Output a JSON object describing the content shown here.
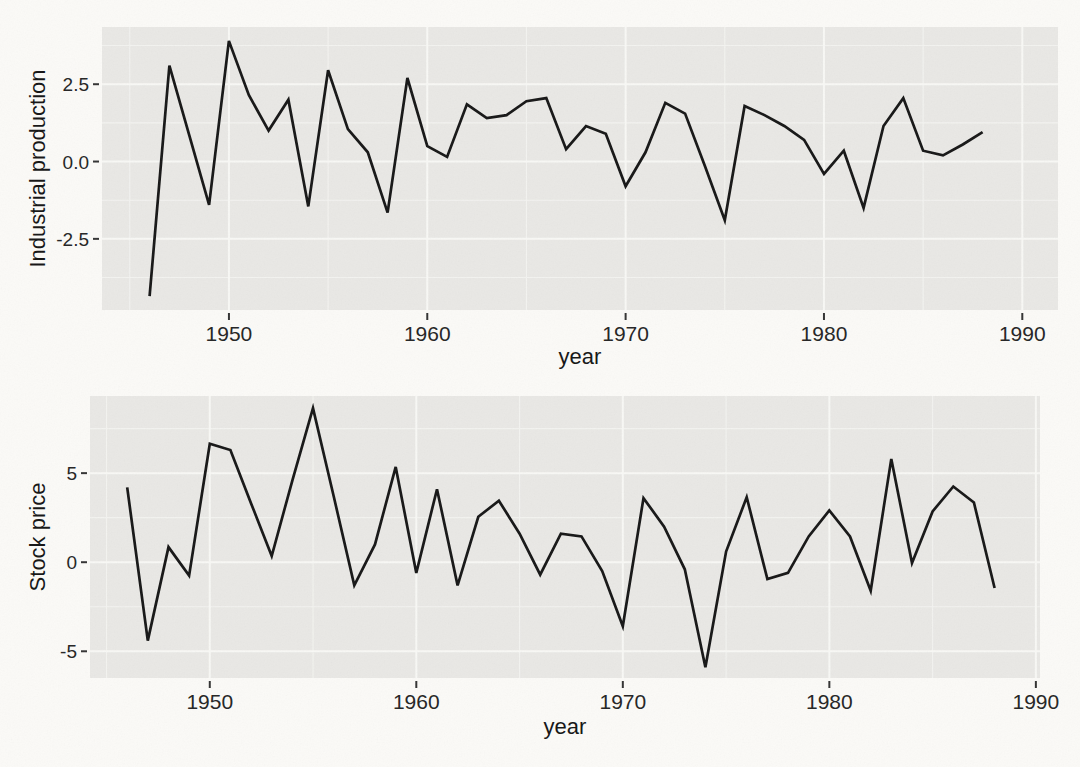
{
  "figure": {
    "background": "#fbfaf7",
    "panel_background": "#e9e8e5",
    "grid_major_color": "#f8f8f5",
    "grid_minor_color": "#f3f3f0",
    "line_color": "#161616",
    "tick_mark_color": "#333333",
    "text_color": "#242424"
  },
  "chart_data": [
    {
      "type": "line",
      "title": "",
      "xlabel": "year",
      "ylabel": "Industrial production",
      "x": [
        1946,
        1947,
        1948,
        1949,
        1950,
        1951,
        1952,
        1953,
        1954,
        1955,
        1956,
        1957,
        1958,
        1959,
        1960,
        1961,
        1962,
        1963,
        1964,
        1965,
        1966,
        1967,
        1968,
        1969,
        1970,
        1971,
        1972,
        1973,
        1974,
        1975,
        1976,
        1977,
        1978,
        1979,
        1980,
        1981,
        1982,
        1983,
        1984,
        1985,
        1986,
        1987,
        1988
      ],
      "values": [
        -4.35,
        3.1,
        0.85,
        -1.4,
        3.9,
        2.15,
        1.0,
        2.0,
        -1.45,
        2.95,
        1.05,
        0.3,
        -1.65,
        2.7,
        0.5,
        0.15,
        1.85,
        1.4,
        1.5,
        1.95,
        2.05,
        0.4,
        1.15,
        0.9,
        -0.8,
        0.3,
        1.9,
        1.55,
        -0.15,
        -1.9,
        1.8,
        1.5,
        1.15,
        0.7,
        -0.4,
        0.35,
        -1.5,
        1.15,
        2.05,
        0.35,
        0.2,
        0.55,
        0.95
      ],
      "xlim": [
        1943.6,
        1991.8
      ],
      "ylim": [
        -4.8,
        4.35
      ],
      "xticks": [
        1950,
        1960,
        1970,
        1980,
        1990
      ],
      "xtick_labels": [
        "1950",
        "1960",
        "1970",
        "1980",
        "1990"
      ],
      "yticks": [
        2.5,
        0.0,
        -2.5
      ],
      "ytick_labels": [
        "2.5",
        "0.0",
        "-2.5"
      ],
      "grid": "major white + minor white on gray panel",
      "legend": "none"
    },
    {
      "type": "line",
      "title": "",
      "xlabel": "year",
      "ylabel": "Stock price",
      "x": [
        1946,
        1947,
        1948,
        1949,
        1950,
        1951,
        1952,
        1953,
        1954,
        1955,
        1956,
        1957,
        1958,
        1959,
        1960,
        1961,
        1962,
        1963,
        1964,
        1965,
        1966,
        1967,
        1968,
        1969,
        1970,
        1971,
        1972,
        1973,
        1974,
        1975,
        1976,
        1977,
        1978,
        1979,
        1980,
        1981,
        1982,
        1983,
        1984,
        1985,
        1986,
        1987,
        1988
      ],
      "values": [
        4.2,
        -4.4,
        0.85,
        -0.75,
        6.65,
        6.3,
        3.3,
        0.35,
        4.6,
        8.65,
        3.7,
        -1.3,
        1.0,
        5.35,
        -0.6,
        4.1,
        -1.3,
        2.55,
        3.45,
        1.6,
        -0.7,
        1.6,
        1.45,
        -0.5,
        -3.6,
        3.6,
        2.0,
        -0.4,
        -5.9,
        0.6,
        3.65,
        -0.95,
        -0.6,
        1.45,
        2.9,
        1.45,
        -1.6,
        5.8,
        -0.05,
        2.85,
        4.25,
        3.35,
        -1.45
      ],
      "xlim": [
        1944.2,
        1990.2
      ],
      "ylim": [
        -6.5,
        9.33
      ],
      "xticks": [
        1950,
        1960,
        1970,
        1980,
        1990
      ],
      "xtick_labels": [
        "1950",
        "1960",
        "1970",
        "1980",
        "1990"
      ],
      "yticks": [
        5,
        0,
        -5
      ],
      "ytick_labels": [
        "5",
        "0",
        "-5"
      ],
      "grid": "major white + minor white on gray panel",
      "legend": "none"
    }
  ]
}
